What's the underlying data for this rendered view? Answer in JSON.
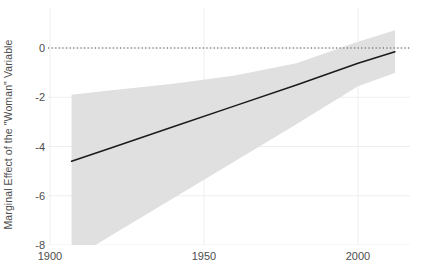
{
  "chart_data": {
    "type": "line",
    "title": "",
    "subtitle": "",
    "xlabel": "",
    "ylabel": "Marginal Effect of the \"Woman\" Variable",
    "xlim": [
      1900,
      2016
    ],
    "ylim": [
      -8,
      0.9
    ],
    "xticks": [
      1900,
      1950,
      2000
    ],
    "xticklabels": [
      "1900",
      "1950",
      "2000"
    ],
    "yticks": [
      0,
      -2,
      -4,
      -6,
      -8
    ],
    "yticklabels": [
      "0",
      "-2",
      "-4",
      "-6",
      "-8"
    ],
    "grid": true,
    "legend": "none",
    "reference_line": {
      "name": "zero-line",
      "y": 0,
      "style": "dotted",
      "color": "#4d4d4d"
    },
    "series": [
      {
        "name": "Marginal effect",
        "type": "line",
        "color": "#1a1a1a",
        "x": [
          1907,
          1920,
          1940,
          1960,
          1980,
          2000,
          2012
        ],
        "values": [
          -4.6,
          -4.05,
          -3.2,
          -2.35,
          -1.5,
          -0.62,
          -0.15
        ]
      },
      {
        "name": "95% confidence interval",
        "type": "ribbon",
        "color": "#e0e0e0",
        "x": [
          1907,
          1920,
          1940,
          1960,
          1980,
          2000,
          2012
        ],
        "upper": [
          -1.9,
          -1.72,
          -1.45,
          -1.12,
          -0.62,
          0.25,
          0.72
        ],
        "lower": [
          -8.6,
          -7.6,
          -6.1,
          -4.6,
          -3.1,
          -1.55,
          -1.02
        ]
      }
    ],
    "annotations": []
  },
  "colors": {
    "line": "#1a1a1a",
    "ribbon": "#e0e0e0",
    "grid": "#ececec",
    "text": "#4d4d4d",
    "panel_background": "#ffffff",
    "reference_line": "#4d4d4d"
  }
}
